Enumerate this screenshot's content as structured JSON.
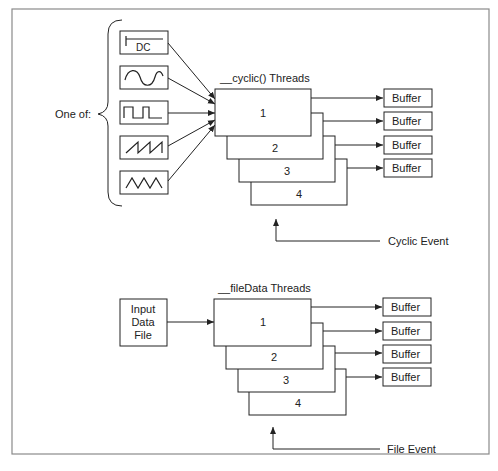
{
  "diagram": {
    "left_label": "One of:",
    "signal_sources": [
      {
        "icon": "dc-signal-icon",
        "label": "DC"
      },
      {
        "icon": "sine-wave-icon",
        "label": ""
      },
      {
        "icon": "square-wave-icon",
        "label": ""
      },
      {
        "icon": "sawtooth-wave-icon",
        "label": ""
      },
      {
        "icon": "triangle-wave-icon",
        "label": ""
      }
    ],
    "cyclic_group": {
      "title": "__cyclic() Threads",
      "threads": [
        "1",
        "2",
        "3",
        "4"
      ],
      "buffers": [
        "Buffer",
        "Buffer",
        "Buffer",
        "Buffer"
      ],
      "event_label": "Cyclic Event"
    },
    "file_group": {
      "input_lines": [
        "Input",
        "Data",
        "File"
      ],
      "title": "__fileData Threads",
      "threads": [
        "1",
        "2",
        "3",
        "4"
      ],
      "buffers": [
        "Buffer",
        "Buffer",
        "Buffer",
        "Buffer"
      ],
      "event_label": "File Event"
    }
  }
}
